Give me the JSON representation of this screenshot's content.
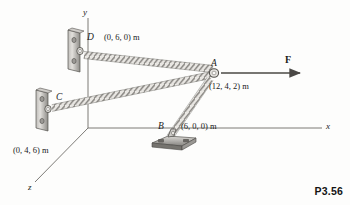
{
  "figure": {
    "caption": "P3.56",
    "background_color": "#fdfdfc",
    "ink_color": "#1b1b1b"
  },
  "axes": [
    {
      "name": "y",
      "label": "y"
    },
    {
      "name": "x",
      "label": "x"
    },
    {
      "name": "z",
      "label": "z"
    }
  ],
  "points": [
    {
      "id": "D",
      "label": "D",
      "coords": "(0, 6, 0) m",
      "support": "wall-bracket"
    },
    {
      "id": "C",
      "label": "C",
      "coords": "(0, 4, 6) m",
      "support": "wall-bracket"
    },
    {
      "id": "B",
      "label": "B",
      "coords": "(6, 0, 0) m",
      "support": "floor-base-plate"
    },
    {
      "id": "A",
      "label": "A",
      "coords": "(12, 4, 2) m",
      "support": "ring"
    }
  ],
  "force": {
    "label": "F",
    "applied_at": "A",
    "direction": "positive-x"
  },
  "cables": [
    {
      "from": "D",
      "to": "A"
    },
    {
      "from": "C",
      "to": "A"
    },
    {
      "from": "B",
      "to": "A"
    }
  ],
  "colors": {
    "rope_light": "#e8e6e2",
    "rope_dark": "#8a8884",
    "metal_light": "#d8d6d2",
    "metal_dark": "#6f6d69",
    "axis": "#6e6c68"
  }
}
